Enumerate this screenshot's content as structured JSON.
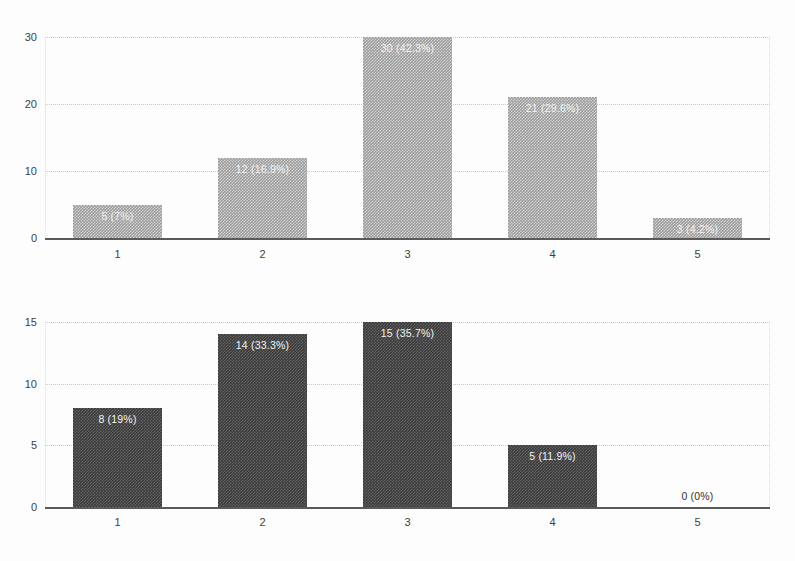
{
  "chart_data": [
    {
      "type": "bar",
      "name": "top-chart",
      "title": "",
      "xlabel": "",
      "ylabel": "",
      "categories": [
        "1",
        "2",
        "3",
        "4",
        "5"
      ],
      "values": [
        5,
        12,
        30,
        21,
        3
      ],
      "percent_labels": [
        "5 (7%)",
        "12 (16.9%)",
        "30 (42.3%)",
        "21 (29.6%)",
        "3 (4.2%)"
      ],
      "label_placement": [
        "inside",
        "inside",
        "inside",
        "inside",
        "inside"
      ],
      "total": 71,
      "ylim": [
        0,
        30
      ],
      "yticks": [
        0,
        10,
        20,
        30
      ],
      "ytick_labels": [
        "0",
        "10",
        "20",
        "30"
      ],
      "grid": true,
      "legend": "none",
      "bar_color": "#9b9b9b",
      "label_color": "#f2f2f2"
    },
    {
      "type": "bar",
      "name": "bottom-chart",
      "title": "",
      "xlabel": "",
      "ylabel": "",
      "categories": [
        "1",
        "2",
        "3",
        "4",
        "5"
      ],
      "values": [
        8,
        14,
        15,
        5,
        0
      ],
      "percent_labels": [
        "8 (19%)",
        "14 (33.3%)",
        "15 (35.7%)",
        "5 (11.9%)",
        "0 (0%)"
      ],
      "label_placement": [
        "inside",
        "inside",
        "inside",
        "inside",
        "outside"
      ],
      "total": 42,
      "ylim": [
        0,
        15
      ],
      "yticks": [
        0,
        5,
        10,
        15
      ],
      "ytick_labels": [
        "0",
        "5",
        "10",
        "15"
      ],
      "grid": true,
      "legend": "none",
      "bar_color": "#3b3b3b",
      "label_color": "#f2f2f2"
    }
  ]
}
